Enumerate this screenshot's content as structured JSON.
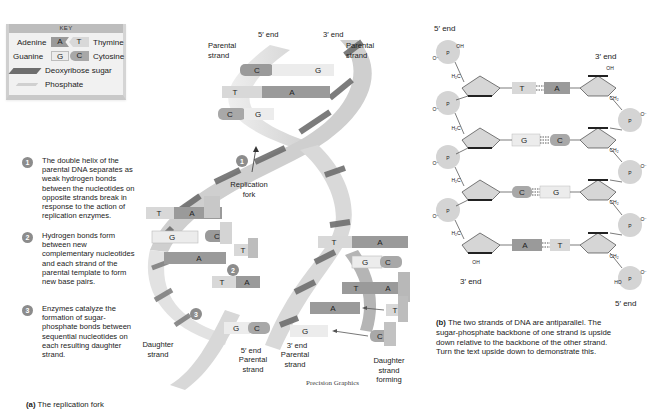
{
  "key": {
    "title": "KEY",
    "pairs": [
      {
        "left_name": "Adenine",
        "left_base": "A",
        "right_base": "T",
        "right_name": "Thymine"
      },
      {
        "left_name": "Guanine",
        "left_base": "G",
        "right_base": "C",
        "right_name": "Cytosine"
      }
    ],
    "sugar_label": "Deoxyribose sugar",
    "phosphate_label": "Phosphate"
  },
  "steps": [
    {
      "num": "1",
      "text": "The double helix of the parental DNA separates as weak hydrogen bonds between the nucleotides on opposite strands break in response to the action of replication enzymes."
    },
    {
      "num": "2",
      "text": "Hydrogen bonds form between new complementary nucleotides and each strand of the parental template to form new base pairs."
    },
    {
      "num": "3",
      "text": "Enzymes catalyze the formation of sugar-phosphate bonds between sequential nucleotides on each resulting daughter strand."
    }
  ],
  "panel_a": {
    "caption_letter": "(a)",
    "caption_text": "The replication fork",
    "labels": {
      "top_5_end": "5′ end",
      "top_3_end": "3′ end",
      "parental_strand_left": "Parental strand",
      "parental_strand_right": "Parental strand",
      "replication_fork": "Replication fork",
      "daughter_strand": "Daughter strand",
      "bottom_5_end": "5′ end",
      "bottom_parental_left": "Parental strand",
      "bottom_3_end": "3′ end",
      "bottom_parental_right": "Parental strand",
      "daughter_strand_forming": "Daughter strand forming",
      "credit": "Precision Graphics"
    },
    "top_pairs": [
      {
        "left": "C",
        "right": "G"
      },
      {
        "left": "T",
        "right": "A"
      },
      {
        "left": "C",
        "right": "G"
      }
    ],
    "left_fork_bases": [
      {
        "strand": "T",
        "incoming": "A"
      },
      {
        "strand": "G",
        "incoming": "C"
      },
      {
        "strand": "A",
        "incoming": "T"
      },
      {
        "strand": "T",
        "incoming": "A"
      },
      {
        "strand": "G",
        "incoming": "C"
      }
    ],
    "right_fork_bases": [
      {
        "strand": "T",
        "incoming": "A"
      },
      {
        "strand": "G",
        "incoming": "C"
      },
      {
        "strand": "T",
        "incoming": "A"
      },
      {
        "strand": "A",
        "incoming": "T"
      },
      {
        "strand": "G",
        "incoming": "C"
      }
    ],
    "step_markers": [
      "1",
      "2",
      "3"
    ]
  },
  "panel_b": {
    "top_left_end": "5′ end",
    "top_right_end": "3′ end",
    "bottom_left_end": "3′ end",
    "bottom_right_end": "5′ end",
    "pairs": [
      {
        "left": "T",
        "right": "A"
      },
      {
        "left": "G",
        "right": "C"
      },
      {
        "left": "C",
        "right": "G"
      },
      {
        "left": "A",
        "right": "T"
      }
    ],
    "chem": {
      "oh": "OH",
      "h2c": "H₂C",
      "ch2": "CH₂",
      "p": "P",
      "o": "O",
      "o_minus": "O⁻",
      "ho": "HO"
    },
    "caption_letter": "(b)",
    "caption_text": "The two strands of DNA are antiparallel. The sugar-phosphate backbone of one strand is upside down relative to the backbone of the other strand. Turn the text upside down to demonstrate this."
  },
  "colors": {
    "base_A": "#9a9a9a",
    "base_T": "#d8d8d8",
    "base_G": "#ececec",
    "base_C": "#a8a8a8",
    "sugar_dark": "#6e6e6e",
    "sugar_light": "#bdbdbd",
    "phosphate_circle": "#d4d4d4",
    "step_circle": "#8c8c8c"
  }
}
